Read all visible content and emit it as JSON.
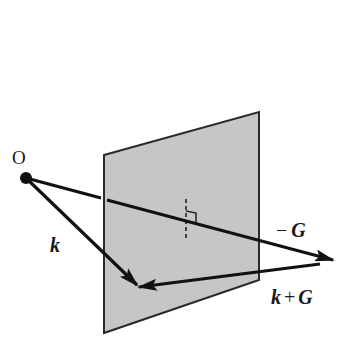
{
  "diagram": {
    "colors": {
      "plane_fill": "#c6c6c6",
      "plane_edge": "#2a2a2a",
      "vector": "#111111",
      "background": "#ffffff"
    },
    "origin": {
      "label": "O",
      "x": 26,
      "y": 178
    },
    "plane": {
      "name": "Bragg plane",
      "corners": [
        [
          104,
          155
        ],
        [
          259,
          112
        ],
        [
          259,
          280
        ],
        [
          104,
          333
        ]
      ]
    },
    "vectors": [
      {
        "id": "k",
        "label": "k",
        "from": [
          26,
          178
        ],
        "to": [
          137,
          285
        ]
      },
      {
        "id": "minus-G",
        "label_sign": "−",
        "label": "G",
        "from": [
          26,
          178
        ],
        "to": [
          333,
          260
        ]
      },
      {
        "id": "k-plus-G",
        "label_left": "k",
        "label_op": "+",
        "label_right": "G",
        "from": [
          320,
          264
        ],
        "to": [
          139,
          287
        ]
      }
    ],
    "perpendicular_marker": {
      "dashed_line": {
        "x": 186,
        "y1": 199,
        "y2": 241
      },
      "right_angle": [
        [
          186,
          211
        ],
        [
          196,
          213
        ],
        [
          196,
          223
        ]
      ]
    },
    "labels": {
      "origin": "O",
      "k": "k",
      "minus_sign": "−",
      "G": "G",
      "kpg_k": "k",
      "kpg_plus": "+",
      "kpg_G": "G"
    }
  }
}
